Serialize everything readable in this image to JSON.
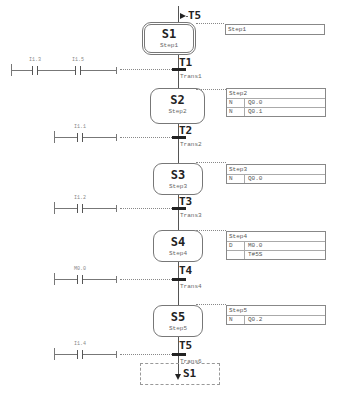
{
  "diagram": {
    "type": "SFC / GRAPH sequencer",
    "entry_jump": {
      "from_transition": "T5"
    },
    "steps": [
      {
        "name": "S1",
        "label": "Step1",
        "initial": true,
        "action_table": {
          "header": "Step1",
          "actions": []
        }
      },
      {
        "name": "S2",
        "label": "Step2",
        "initial": false,
        "action_table": {
          "header": "Step2",
          "actions": [
            {
              "qualifier": "N",
              "operand": "Q0.0"
            },
            {
              "qualifier": "N",
              "operand": "Q0.1"
            }
          ]
        }
      },
      {
        "name": "S3",
        "label": "Step3",
        "initial": false,
        "action_table": {
          "header": "Step3",
          "actions": [
            {
              "qualifier": "N",
              "operand": "Q0.0"
            }
          ]
        }
      },
      {
        "name": "S4",
        "label": "Step4",
        "initial": false,
        "action_table": {
          "header": "Step4",
          "actions": [
            {
              "qualifier": "D",
              "operand": "M0.0"
            },
            {
              "qualifier": "",
              "operand": "T#5S"
            }
          ]
        }
      },
      {
        "name": "S5",
        "label": "Step5",
        "initial": false,
        "action_table": {
          "header": "Step5",
          "actions": [
            {
              "qualifier": "N",
              "operand": "Q0.2"
            }
          ]
        }
      }
    ],
    "transitions": [
      {
        "name": "T1",
        "label": "Trans1",
        "contacts": [
          "I1.3",
          "I1.5"
        ]
      },
      {
        "name": "T2",
        "label": "Trans2",
        "contacts": [
          "I1.1"
        ]
      },
      {
        "name": "T3",
        "label": "Trans3",
        "contacts": [
          "I1.2"
        ]
      },
      {
        "name": "T4",
        "label": "Trans4",
        "contacts": [
          "M0.0"
        ]
      },
      {
        "name": "T5",
        "label": "Trans6",
        "contacts": [
          "I1.4"
        ]
      }
    ],
    "exit_jump": {
      "to_step": "S1"
    }
  }
}
